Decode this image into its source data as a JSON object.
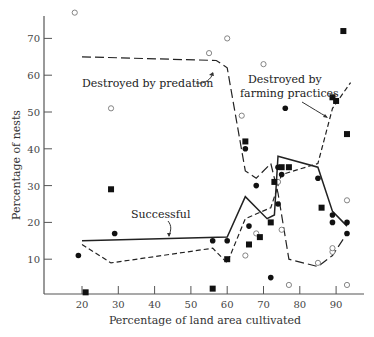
{
  "chart_data": {
    "type": "scatter",
    "title": "",
    "xlabel": "Percentage of land area cultivated",
    "ylabel": "Percentage of nests",
    "xlim": [
      12,
      97
    ],
    "ylim": [
      0,
      76
    ],
    "xticks": [
      20,
      30,
      40,
      50,
      60,
      70,
      80,
      90
    ],
    "yticks": [
      10,
      20,
      30,
      40,
      50,
      60,
      70
    ],
    "grid": false,
    "legend": "none (inline annotations)",
    "annotations": [
      {
        "text": "Destroyed by predation",
        "x": 20,
        "y": 59
      },
      {
        "text": "Destroyed by farming practices",
        "x": 78,
        "y": 60
      },
      {
        "text": "Successful",
        "x": 38,
        "y": 19
      }
    ],
    "series": [
      {
        "name": "Successful",
        "kind": "line",
        "style": "solid",
        "points": [
          [
            20,
            15
          ],
          [
            60,
            16
          ],
          [
            65,
            27
          ],
          [
            71,
            21
          ],
          [
            73,
            22
          ],
          [
            74,
            38
          ],
          [
            85,
            35
          ],
          [
            89,
            23
          ],
          [
            93,
            19
          ]
        ]
      },
      {
        "name": "Destroyed by predation",
        "kind": "line",
        "style": "long-dash",
        "points": [
          [
            20,
            65
          ],
          [
            57,
            64
          ],
          [
            60,
            62
          ],
          [
            65,
            34
          ],
          [
            68,
            32
          ],
          [
            72,
            36
          ],
          [
            74,
            28
          ],
          [
            77,
            10
          ],
          [
            85,
            8
          ],
          [
            89,
            11
          ],
          [
            93,
            17
          ]
        ]
      },
      {
        "name": "Destroyed by farming practices",
        "kind": "line",
        "style": "short-dash",
        "points": [
          [
            20,
            14
          ],
          [
            28,
            9
          ],
          [
            56,
            13
          ],
          [
            60,
            9
          ],
          [
            65,
            21
          ],
          [
            72,
            24
          ],
          [
            75,
            33
          ],
          [
            85,
            36
          ],
          [
            89,
            51
          ],
          [
            94,
            58
          ]
        ]
      },
      {
        "name": "Successful (observed)",
        "kind": "scatter",
        "marker": "filled-circle",
        "points": [
          [
            19,
            11
          ],
          [
            29,
            17
          ],
          [
            56,
            15
          ],
          [
            60,
            15
          ],
          [
            65,
            40
          ],
          [
            66,
            19
          ],
          [
            68,
            30
          ],
          [
            72,
            5
          ],
          [
            74,
            35
          ],
          [
            74,
            25
          ],
          [
            75,
            33
          ],
          [
            76,
            51
          ],
          [
            85,
            32
          ],
          [
            89,
            20
          ],
          [
            89,
            22
          ],
          [
            93,
            17
          ],
          [
            93,
            20
          ]
        ]
      },
      {
        "name": "Destroyed by predation (observed)",
        "kind": "scatter",
        "marker": "open-circle",
        "points": [
          [
            18,
            77
          ],
          [
            28,
            51
          ],
          [
            55,
            66
          ],
          [
            60,
            70
          ],
          [
            64,
            49
          ],
          [
            65,
            11
          ],
          [
            68,
            17
          ],
          [
            70,
            63
          ],
          [
            74,
            31
          ],
          [
            75,
            18
          ],
          [
            77,
            3
          ],
          [
            85,
            9
          ],
          [
            89,
            12
          ],
          [
            89,
            13
          ],
          [
            93,
            3
          ],
          [
            93,
            26
          ]
        ]
      },
      {
        "name": "Destroyed by farming practices (observed)",
        "kind": "scatter",
        "marker": "filled-square",
        "points": [
          [
            21,
            1
          ],
          [
            28,
            29
          ],
          [
            56,
            2
          ],
          [
            60,
            10
          ],
          [
            65,
            42
          ],
          [
            66,
            14
          ],
          [
            69,
            16
          ],
          [
            72,
            20
          ],
          [
            73,
            31
          ],
          [
            75,
            35
          ],
          [
            77,
            35
          ],
          [
            86,
            24
          ],
          [
            89,
            54
          ],
          [
            90,
            53
          ],
          [
            92,
            72
          ],
          [
            93,
            44
          ]
        ]
      }
    ]
  },
  "labels": {
    "xlabel": "Percentage of land area cultivated",
    "ylabel": "Percentage of nests",
    "annot_predation": "Destroyed by predation",
    "annot_farming_1": "Destroyed by",
    "annot_farming_2": "farming practices",
    "annot_successful": "Successful"
  }
}
